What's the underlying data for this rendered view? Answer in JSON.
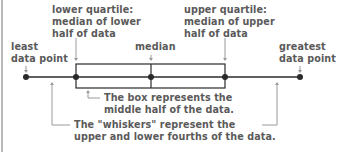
{
  "diagram": {
    "labels": {
      "lower_quartile": [
        "lower quartile:",
        "median of lower",
        "half of data"
      ],
      "upper_quartile": [
        "upper quartile:",
        "median of upper",
        "half of data"
      ],
      "least": [
        "least",
        "data point"
      ],
      "median": "median",
      "greatest": [
        "greatest",
        "data point"
      ],
      "box_note": [
        "The box represents the",
        "middle half of the data."
      ],
      "whisker_note": [
        "The \"whiskers\" represent the",
        "upper and lower fourths of the data."
      ]
    },
    "points": {
      "least_x": 26,
      "lower_quartile_x": 76,
      "median_x": 151,
      "upper_quartile_x": 225,
      "greatest_x": 300,
      "axis_y": 77,
      "box_top_y": 64,
      "box_bottom_y": 88
    },
    "colors": {
      "line": "#2a2a2a",
      "pointer": "#9a9a9a",
      "text": "#5a5a5a",
      "border": "#b9b9b9"
    }
  }
}
